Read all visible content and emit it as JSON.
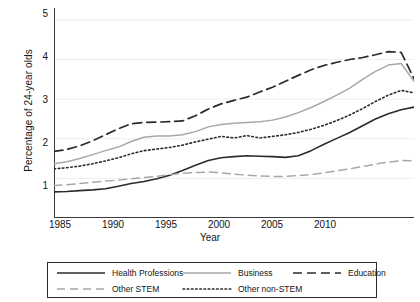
{
  "chart_data": {
    "type": "line",
    "title": "",
    "xlabel": "Year",
    "ylabel": "Percentage of 24-year olds",
    "xlim": [
      1985,
      2013
    ],
    "ylim": [
      0,
      5.3
    ],
    "xticks": [
      1985,
      1990,
      1995,
      2000,
      2005,
      2010
    ],
    "yticks": [
      1,
      2,
      3,
      4,
      5
    ],
    "grid": "horizontal-light",
    "legend_position": "below-axes",
    "x": [
      1985,
      1986,
      1987,
      1988,
      1989,
      1990,
      1991,
      1992,
      1993,
      1994,
      1995,
      1996,
      1997,
      1998,
      1999,
      2000,
      2001,
      2002,
      2003,
      2004,
      2005,
      2006,
      2007,
      2008,
      2009,
      2010,
      2011,
      2012,
      2013
    ],
    "series": [
      {
        "name": "Health Professions",
        "style": "solid",
        "color": "#2b2b2b",
        "width": 1.6,
        "values": [
          0.66,
          0.67,
          0.69,
          0.71,
          0.74,
          0.8,
          0.87,
          0.92,
          0.99,
          1.08,
          1.2,
          1.33,
          1.45,
          1.52,
          1.55,
          1.57,
          1.56,
          1.55,
          1.53,
          1.57,
          1.7,
          1.86,
          2.01,
          2.16,
          2.33,
          2.5,
          2.63,
          2.73,
          2.8
        ]
      },
      {
        "name": "Business",
        "style": "solid",
        "color": "#a8a8a8",
        "width": 1.5,
        "values": [
          1.37,
          1.42,
          1.5,
          1.6,
          1.7,
          1.79,
          1.93,
          2.04,
          2.07,
          2.07,
          2.1,
          2.18,
          2.3,
          2.36,
          2.39,
          2.41,
          2.43,
          2.47,
          2.55,
          2.66,
          2.79,
          2.94,
          3.1,
          3.28,
          3.5,
          3.7,
          3.86,
          3.9,
          3.45
        ]
      },
      {
        "name": "Education",
        "style": "long-dash",
        "color": "#2b2b2b",
        "width": 1.7,
        "values": [
          1.68,
          1.73,
          1.82,
          1.95,
          2.1,
          2.25,
          2.38,
          2.41,
          2.42,
          2.43,
          2.45,
          2.58,
          2.75,
          2.88,
          2.97,
          3.05,
          3.18,
          3.3,
          3.45,
          3.6,
          3.74,
          3.85,
          3.93,
          4.0,
          4.05,
          4.12,
          4.2,
          4.18,
          3.52
        ]
      },
      {
        "name": "Other STEM",
        "style": "dashed",
        "color": "#a8a8a8",
        "width": 1.5,
        "values": [
          0.82,
          0.84,
          0.87,
          0.9,
          0.93,
          0.96,
          0.99,
          1.02,
          1.05,
          1.09,
          1.13,
          1.15,
          1.16,
          1.14,
          1.11,
          1.08,
          1.06,
          1.05,
          1.05,
          1.07,
          1.1,
          1.14,
          1.19,
          1.24,
          1.3,
          1.36,
          1.41,
          1.45,
          1.44
        ]
      },
      {
        "name": "Other non-STEM",
        "style": "dotted",
        "color": "#2b2b2b",
        "width": 1.6,
        "values": [
          1.24,
          1.27,
          1.31,
          1.37,
          1.44,
          1.52,
          1.62,
          1.7,
          1.74,
          1.78,
          1.84,
          1.92,
          1.99,
          2.06,
          2.02,
          2.08,
          2.02,
          2.06,
          2.1,
          2.16,
          2.24,
          2.34,
          2.46,
          2.6,
          2.76,
          2.94,
          3.1,
          3.22,
          3.16
        ]
      }
    ]
  },
  "axis": {
    "ylabel": "Percentage of 24-year olds",
    "xlabel": "Year",
    "yticks": [
      "1",
      "2",
      "3",
      "4",
      "5"
    ],
    "xticks": [
      "1985",
      "1990",
      "1995",
      "2000",
      "2005",
      "2010"
    ]
  },
  "legend": {
    "items": [
      {
        "label": "Health Professions"
      },
      {
        "label": "Business"
      },
      {
        "label": "Education"
      },
      {
        "label": "Other STEM"
      },
      {
        "label": "Other non-STEM"
      }
    ]
  }
}
